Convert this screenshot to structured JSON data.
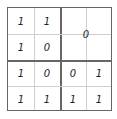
{
  "grid": {
    "rows": 4,
    "cols": 4,
    "cells": [
      [
        "1",
        "1",
        null,
        null
      ],
      [
        "1",
        "0",
        null,
        null
      ],
      [
        "1",
        "0",
        "0",
        "1"
      ],
      [
        "1",
        "1",
        "1",
        "1"
      ]
    ],
    "merged_block": {
      "position": "top-right 2x2",
      "value": "0"
    },
    "r0c0": "1",
    "r0c1": "1",
    "r1c0": "1",
    "r1c1": "0",
    "r2c0": "1",
    "r2c1": "0",
    "r2c2": "0",
    "r2c3": "1",
    "r3c0": "1",
    "r3c1": "1",
    "r3c2": "1",
    "r3c3": "1",
    "merged_value": "0"
  },
  "colors": {
    "border": "#666666",
    "thin_line": "#cfcfcf",
    "text": "#222222"
  }
}
